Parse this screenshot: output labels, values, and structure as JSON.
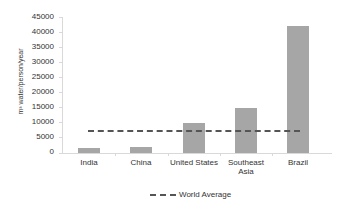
{
  "chart_data": {
    "type": "bar",
    "title": "",
    "xlabel": "",
    "ylabel": "m³ water/person/year",
    "ylim": [
      0,
      45000
    ],
    "yticks": [
      "45000",
      "40000",
      "35000",
      "30000",
      "25000",
      "20000",
      "15000",
      "10000",
      "5000",
      "0"
    ],
    "categories": [
      "India",
      "China",
      "United States",
      "Southeast Asia",
      "Brazil"
    ],
    "category_labels": [
      [
        "India"
      ],
      [
        "China"
      ],
      [
        "United States"
      ],
      [
        "Southeast",
        "Asia"
      ],
      [
        "Brazil"
      ]
    ],
    "values": [
      1700,
      2000,
      10000,
      15000,
      42000
    ],
    "reference_lines": [
      {
        "name": "World Average",
        "value": 7600,
        "style": "dashed"
      }
    ],
    "legend": [
      "World Average"
    ],
    "legend_position": "bottom",
    "grid": false,
    "colors": {
      "bar": "#a6a6a6",
      "line": "#555555"
    }
  }
}
